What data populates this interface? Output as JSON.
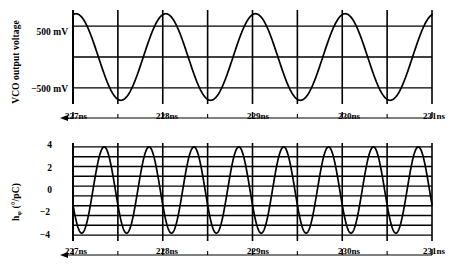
{
  "figure": {
    "background": "#ffffff",
    "ink": "#000000"
  },
  "panels": {
    "top": {
      "name": "vco-output-voltage-plot",
      "ylabel": "VCO output voltage",
      "yticks": [
        {
          "value": 500,
          "label": "500 mV"
        },
        {
          "value": 0,
          "label": ""
        },
        {
          "value": -500,
          "label": "−500 mV"
        }
      ],
      "xticks": [
        {
          "value": 227,
          "label": "227ns"
        },
        {
          "value": 228,
          "label": "228ns"
        },
        {
          "value": 229,
          "label": "229ns"
        },
        {
          "value": 230,
          "label": "230ns"
        },
        {
          "value": 231,
          "label": "231ns"
        }
      ]
    },
    "bottom": {
      "name": "h-phi-plot",
      "ylabel_main": "h",
      "ylabel_sub": "φ",
      "ylabel_units": " (°/pC)",
      "yticks": [
        {
          "value": 4,
          "label": "4"
        },
        {
          "value": 2,
          "label": "2"
        },
        {
          "value": 0,
          "label": "0"
        },
        {
          "value": -2,
          "label": "−2"
        },
        {
          "value": -4,
          "label": "−4"
        }
      ],
      "xticks": [
        {
          "value": 227,
          "label": "227ns"
        },
        {
          "value": 228,
          "label": "228ns"
        },
        {
          "value": 229,
          "label": "229ns"
        },
        {
          "value": 230,
          "label": "230ns"
        },
        {
          "value": 231,
          "label": "231ns"
        }
      ]
    }
  },
  "chart_data": [
    {
      "type": "line",
      "name": "vco-output-voltage",
      "title": "",
      "xlabel": "",
      "ylabel": "VCO output voltage",
      "xlim": [
        227,
        231
      ],
      "ylim": [
        -760,
        760
      ],
      "xunit": "ns",
      "yunit": "mV",
      "grid": true,
      "gridlines_y": [
        500,
        0,
        -500
      ],
      "gridlines_x": [
        227,
        227.5,
        228,
        228.5,
        229,
        229.5,
        230,
        230.5,
        231
      ],
      "xtick_labels": [
        "227ns",
        "228ns",
        "229ns",
        "230ns",
        "231ns"
      ],
      "ytick_labels": [
        "500 mV",
        "−500 mV"
      ],
      "waveform": {
        "shape": "sine",
        "amplitude": 700,
        "offset": 0,
        "frequency_cycles_per_ns": 1.0,
        "phase_deg": 78,
        "description": "Sinusoid starting near positive peak at 227ns, about one cycle per nanosecond, peaks just above the 500 mV gridline and troughs just below the −500 mV gridline."
      }
    },
    {
      "type": "line",
      "name": "h-phi",
      "title": "",
      "xlabel": "",
      "ylabel": "hφ (°/pC)",
      "xlim": [
        227,
        231
      ],
      "ylim": [
        -4.6,
        5.4
      ],
      "xunit": "ns",
      "yunit": "°/pC",
      "grid": true,
      "gridlines_y": [
        5,
        4,
        3,
        2,
        1,
        0,
        -1,
        -2,
        -3,
        -4
      ],
      "gridlines_x": [
        227,
        227.5,
        228,
        228.5,
        229,
        229.5,
        230,
        230.5,
        231
      ],
      "xtick_labels": [
        "227ns",
        "228ns",
        "229ns",
        "230ns",
        "231ns"
      ],
      "ytick_labels": [
        "4",
        "2",
        "0",
        "−2",
        "−4"
      ],
      "waveform": {
        "shape": "sine",
        "amplitude": 4.4,
        "offset": 0.6,
        "frequency_cycles_per_ns": 2.0,
        "phase_deg": 200,
        "description": "Sinusoid at twice the VCO rate, roughly two cycles per nanosecond, peaking near +5 and dipping to about −4."
      }
    }
  ]
}
